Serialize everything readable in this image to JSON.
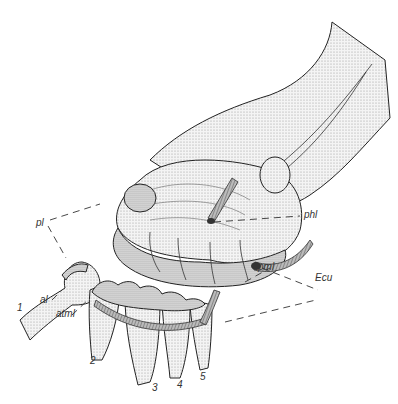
{
  "figure": {
    "labels": {
      "pl": "pl",
      "phl": "phl",
      "pml": "pml",
      "ecu": "Ecu",
      "al": "al",
      "atml": "atml"
    },
    "digits": [
      "1",
      "2",
      "3",
      "4",
      "5"
    ]
  }
}
